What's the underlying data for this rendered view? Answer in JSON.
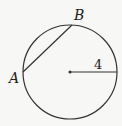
{
  "diagram": {
    "circle": {
      "cx": 70,
      "cy": 72,
      "r": 47
    },
    "points": {
      "A": {
        "label": "A",
        "x": 23,
        "y": 72
      },
      "B": {
        "label": "B",
        "x": 72,
        "y": 25
      }
    },
    "radius_label": "4",
    "stroke_color": "#333333"
  }
}
